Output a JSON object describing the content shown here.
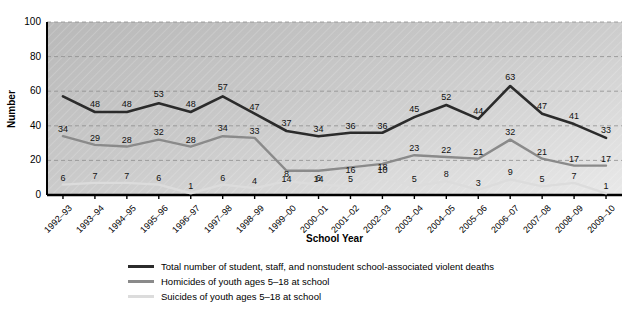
{
  "chart_data": {
    "type": "line",
    "title": "",
    "xlabel": "School Year",
    "ylabel": "Number",
    "ylim": [
      0,
      100
    ],
    "yticks": [
      0,
      20,
      40,
      60,
      80,
      100
    ],
    "grid": true,
    "legend_position": "bottom",
    "categories": [
      "1992–93",
      "1993–94",
      "1994–95",
      "1995–96",
      "1996–97",
      "1997–98",
      "1998–99",
      "1999–00",
      "2000–01",
      "2001–02",
      "2002–03",
      "2003–04",
      "2004–05",
      "2005–06",
      "2006–07",
      "2007–08",
      "2008–09",
      "2009–10"
    ],
    "series": [
      {
        "name": "Total number of student, staff, and nonstudent school-associated violent deaths",
        "color": "#2b2b2b",
        "values": [
          57,
          48,
          48,
          53,
          48,
          57,
          47,
          37,
          34,
          36,
          36,
          45,
          52,
          44,
          63,
          47,
          41,
          33
        ],
        "labels": [
          "",
          "48",
          "48",
          "53",
          "48",
          "57",
          "47",
          "37",
          "34",
          "36",
          "36",
          "45",
          "52",
          "44",
          "63",
          "47",
          "41",
          "33"
        ]
      },
      {
        "name": "Homicides of youth ages 5–18 at school",
        "color": "#8a8a8a",
        "values": [
          34,
          29,
          28,
          32,
          28,
          34,
          33,
          14,
          14,
          16,
          18,
          23,
          22,
          21,
          32,
          21,
          17,
          17
        ],
        "labels": [
          "34",
          "29",
          "28",
          "32",
          "28",
          "34",
          "33",
          "14",
          "14",
          "16",
          "18",
          "23",
          "22",
          "21",
          "32",
          "21",
          "17",
          "17"
        ]
      },
      {
        "name": "Suicides of youth ages 5–18 at school",
        "color": "#dcdcdc",
        "values": [
          6,
          7,
          7,
          6,
          1,
          6,
          4,
          8,
          6,
          5,
          10,
          5,
          8,
          3,
          9,
          5,
          7,
          1
        ],
        "labels": [
          "6",
          "7",
          "7",
          "6",
          "1",
          "6",
          "4",
          "8",
          "6",
          "5",
          "10",
          "5",
          "8",
          "3",
          "9",
          "5",
          "7",
          "1"
        ]
      }
    ]
  },
  "legend": {
    "items": [
      {
        "label": "Total number of student, staff, and nonstudent school-associated violent deaths",
        "color": "#2b2b2b"
      },
      {
        "label": "Homicides of youth ages 5–18 at school",
        "color": "#8a8a8a"
      },
      {
        "label": "Suicides of youth ages 5–18 at school",
        "color": "#dcdcdc"
      }
    ]
  }
}
